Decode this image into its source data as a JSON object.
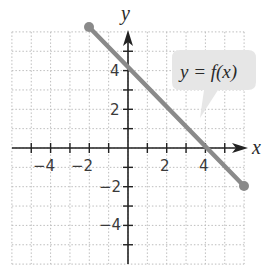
{
  "chart_data": {
    "type": "line",
    "title": "",
    "xlabel": "x",
    "ylabel": "y",
    "xlim": [
      -6,
      6
    ],
    "ylim": [
      -6,
      6
    ],
    "grid": true,
    "grid_style": "dotted",
    "x_ticks": [
      -5,
      -4,
      -3,
      -2,
      -1,
      1,
      2,
      3,
      4,
      5
    ],
    "y_ticks": [
      -5,
      -4,
      -3,
      -2,
      -1,
      1,
      2,
      3,
      4,
      5
    ],
    "x_tick_labels": [
      {
        "value": -4,
        "label": "−4"
      },
      {
        "value": -2,
        "label": "−2"
      },
      {
        "value": 2,
        "label": "2"
      },
      {
        "value": 4,
        "label": "4"
      }
    ],
    "y_tick_labels": [
      {
        "value": 4,
        "label": "4"
      },
      {
        "value": 2,
        "label": "2"
      },
      {
        "value": -2,
        "label": "−2"
      },
      {
        "value": -4,
        "label": "−4"
      }
    ],
    "series": [
      {
        "name": "y = f(x)",
        "equation": "y = -x + 4",
        "x": [
          -2,
          6
        ],
        "y": [
          6,
          -2
        ],
        "endpoints": "closed",
        "color": "#8a8a8a"
      }
    ],
    "annotations": [
      {
        "text": "y = f(x)",
        "type": "callout",
        "points_to": [
          3,
          1
        ]
      }
    ]
  },
  "labels": {
    "x_axis": "x",
    "y_axis": "y",
    "callout": "y = f(x)",
    "tick_x_neg4": "−4",
    "tick_x_neg2": "−2",
    "tick_x_2": "2",
    "tick_x_4": "4",
    "tick_y_4": "4",
    "tick_y_2": "2",
    "tick_y_neg2": "−2",
    "tick_y_neg4": "−4"
  },
  "colors": {
    "line": "#8a8a8a",
    "axis": "#222222",
    "grid": "#b8b8b8",
    "callout_bg": "#e6e6e6"
  }
}
